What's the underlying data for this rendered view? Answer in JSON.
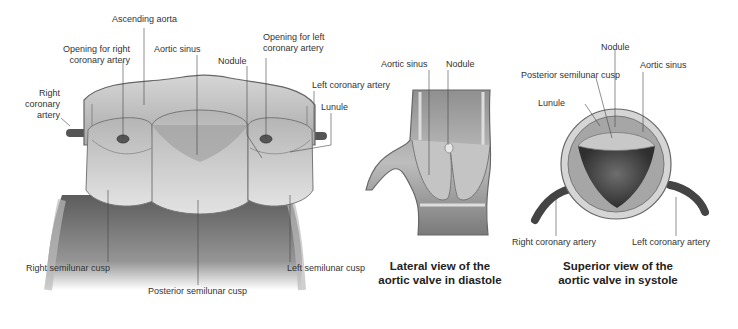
{
  "figure": {
    "main_view": {
      "labels": {
        "ascending_aorta": "Ascending aorta",
        "opening_right_line1": "Opening for right",
        "opening_right_line2": "coronary artery",
        "aortic_sinus": "Aortic sinus",
        "opening_left_line1": "Opening for left",
        "opening_left_line2": "coronary artery",
        "nodule": "Nodule",
        "left_coronary_artery": "Left coronary artery",
        "lunule": "Lunule",
        "right_coronary_line1": "Right",
        "right_coronary_line2": "coronary",
        "right_coronary_line3": "artery",
        "right_semilunar_cusp": "Right semilunar cusp",
        "posterior_semilunar_cusp": "Posterior semilunar cusp",
        "left_semilunar_cusp": "Left semilunar cusp"
      }
    },
    "lateral_view": {
      "labels": {
        "aortic_sinus": "Aortic sinus",
        "nodule": "Nodule"
      },
      "caption_line1": "Lateral view of the",
      "caption_line2": "aortic valve in diastole"
    },
    "superior_view": {
      "labels": {
        "nodule": "Nodule",
        "posterior_semilunar_cusp": "Posterior semilunar cusp",
        "aortic_sinus": "Aortic sinus",
        "lunule": "Lunule",
        "right_coronary_artery": "Right coronary artery",
        "left_coronary_artery": "Left coronary artery"
      },
      "caption_line1": "Superior view of the",
      "caption_line2": "aortic valve in systole"
    }
  }
}
